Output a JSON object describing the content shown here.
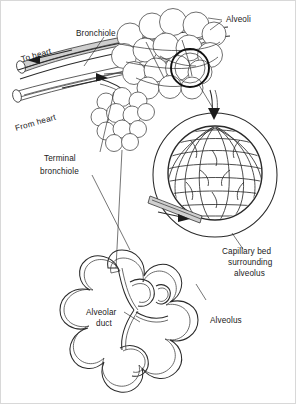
{
  "figure": {
    "background_color": "#ffffff",
    "line_color": "#2a2a2a",
    "vessel_shade_color": "#cfcfcf",
    "width": 296,
    "height": 404
  },
  "labels": {
    "bronchiole": "Bronchiole",
    "to_heart": "To heart",
    "from_heart": "From heart",
    "alveoli": "Alveoli",
    "terminal_bronchiole_line1": "Terminal",
    "terminal_bronchiole_line2": "bronchiole",
    "capillary_bed_line1": "Capillary bed",
    "capillary_bed_line2": "surrounding",
    "capillary_bed_line3": "alveolus",
    "alveolar_duct_line1": "Alveolar",
    "alveolar_duct_line2": "duct",
    "alveolus": "Alveolus"
  },
  "structures": {
    "alveoli_cluster_top": "grape-like cluster of alveolar sacs",
    "alveoli_cluster_small": "smaller grape-like cluster of alveolar sacs",
    "magnified_alveolus": "circular magnified view of a single alveolus",
    "capillary_network": "mesh network of capillaries over alveolus surface",
    "alveolar_duct_outline": "scalloped cloverleaf outline of alveolar duct",
    "pulmonary_vessels": "two shaded tubular blood vessels with flow arrows"
  }
}
